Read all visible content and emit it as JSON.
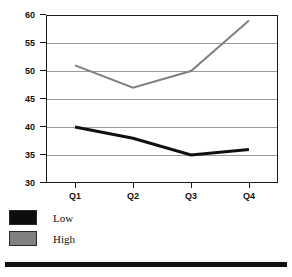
{
  "chart_data": {
    "type": "line",
    "title": "",
    "xlabel": "",
    "ylabel": "",
    "categories": [
      "Q1",
      "Q2",
      "Q3",
      "Q4"
    ],
    "series": [
      {
        "name": "Low",
        "color": "#111111",
        "values": [
          40,
          38,
          35,
          36
        ]
      },
      {
        "name": "High",
        "color": "#808080",
        "values": [
          51,
          47,
          50,
          59
        ]
      }
    ],
    "ylim": [
      30,
      60
    ],
    "y_ticks": [
      60,
      55,
      50,
      45,
      40,
      35,
      30
    ],
    "y_tick_labels": [
      "60",
      "55",
      "50",
      "45",
      "40",
      "35",
      "30"
    ],
    "grid": true,
    "legend_position": "below-left"
  },
  "legend": {
    "entries": [
      {
        "label": "Low",
        "color": "#0d0d0d"
      },
      {
        "label": "High",
        "color": "#808080"
      }
    ]
  },
  "colors": {
    "axis": "#1a1a1a",
    "grid": "#9a9a9a",
    "low_series": "#111111",
    "high_series": "#808080",
    "rule": "#111111",
    "background": "#ffffff"
  },
  "top_clipped_text": ""
}
